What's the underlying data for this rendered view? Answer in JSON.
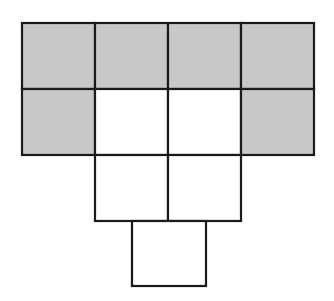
{
  "diagram": {
    "title": "",
    "colors": {
      "shaded": "#c8c8c8",
      "empty": "#ffffff",
      "stroke": "#1a1a1a"
    },
    "cells": [
      {
        "row": 0,
        "col": 0,
        "x": 22,
        "y": 23,
        "w": 73,
        "h": 66,
        "shaded": true
      },
      {
        "row": 0,
        "col": 1,
        "x": 95,
        "y": 23,
        "w": 73,
        "h": 66,
        "shaded": true
      },
      {
        "row": 0,
        "col": 2,
        "x": 168,
        "y": 23,
        "w": 73,
        "h": 66,
        "shaded": true
      },
      {
        "row": 0,
        "col": 3,
        "x": 241,
        "y": 23,
        "w": 73,
        "h": 66,
        "shaded": true
      },
      {
        "row": 1,
        "col": 0,
        "x": 22,
        "y": 89,
        "w": 73,
        "h": 66,
        "shaded": true
      },
      {
        "row": 1,
        "col": 1,
        "x": 95,
        "y": 89,
        "w": 73,
        "h": 66,
        "shaded": false
      },
      {
        "row": 1,
        "col": 2,
        "x": 168,
        "y": 89,
        "w": 73,
        "h": 66,
        "shaded": false
      },
      {
        "row": 1,
        "col": 3,
        "x": 241,
        "y": 89,
        "w": 73,
        "h": 66,
        "shaded": true
      },
      {
        "row": 2,
        "col": 1,
        "x": 95,
        "y": 155,
        "w": 73,
        "h": 66,
        "shaded": false
      },
      {
        "row": 2,
        "col": 2,
        "x": 168,
        "y": 155,
        "w": 73,
        "h": 66,
        "shaded": false
      },
      {
        "row": 3,
        "col": "1.5",
        "x": 132,
        "y": 221,
        "w": 74,
        "h": 65,
        "shaded": false
      }
    ]
  }
}
